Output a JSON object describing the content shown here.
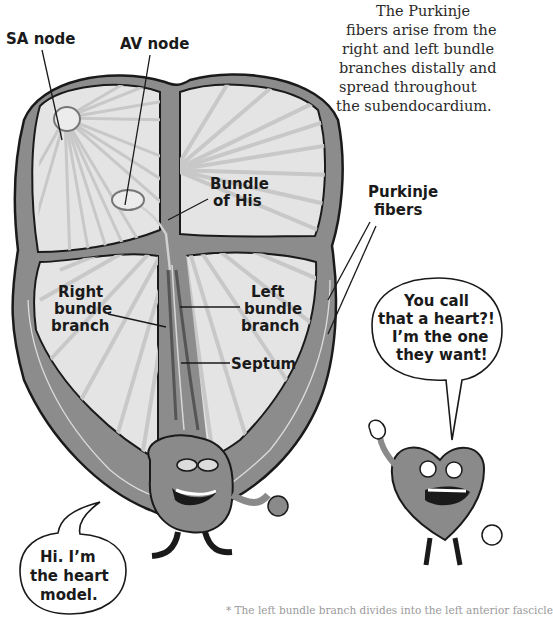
{
  "caption": {
    "lines": [
      "The Purkinje",
      "fibers arise from the",
      "right and left bundle",
      "branches distally and",
      "spread throughout",
      "the subendocardium."
    ]
  },
  "labels": {
    "sa_node": "SA node",
    "av_node": "AV node",
    "bundle_of_his": [
      "Bundle",
      "of His"
    ],
    "purkinje_fibers": [
      "Purkinje",
      "fibers"
    ],
    "right_bundle_branch": [
      "Right",
      "bundle",
      "branch"
    ],
    "left_bundle_branch": [
      "Left",
      "bundle",
      "branch"
    ],
    "septum": "Septum"
  },
  "speech_bubbles": {
    "heart_model": [
      "Hi. I’m",
      "the heart",
      "model."
    ],
    "cartoon_heart": [
      "You call",
      "that a heart?!",
      "I’m the one",
      "they want!"
    ]
  },
  "footnote": "* The left bundle branch divides into the left anterior fascicle",
  "colors": {
    "wall": "#8c8c8c",
    "chamber": "#e2e2e2",
    "ray": "#c6c6c6",
    "outline": "#1a1a1a",
    "character": "#8a8a8a"
  }
}
